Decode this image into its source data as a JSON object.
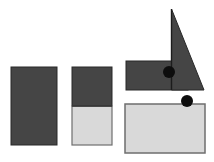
{
  "figure": {
    "description_label": "",
    "canvas": {
      "width": 214,
      "height": 162,
      "background": "#ffffff"
    }
  },
  "colors": {
    "background": "#ffffff",
    "dark_fill": "#454545",
    "dark_stroke": "#282828",
    "light_fill": "#d9d9d9",
    "light_stroke": "#6e6e6e",
    "split_line": "#2e2e2e",
    "edge_line": "#1c1c1c",
    "dot_fill": "#0d0d0d"
  },
  "shapes": [
    {
      "name": "left-dark-rectangle",
      "type": "rect",
      "x": 11,
      "y": 67,
      "w": 46,
      "h": 78,
      "fill": "dark_fill",
      "stroke": "dark_stroke",
      "stroke_width": 1
    },
    {
      "name": "middle-rectangle-dark-half",
      "type": "rect",
      "x": 72,
      "y": 67,
      "w": 40,
      "h": 39,
      "fill": "dark_fill",
      "stroke": "dark_stroke",
      "stroke_width": 1
    },
    {
      "name": "middle-rectangle-light-half",
      "type": "rect",
      "x": 72,
      "y": 106,
      "w": 40,
      "h": 39,
      "fill": "light_fill",
      "stroke": "light_stroke",
      "stroke_width": 1.2
    },
    {
      "name": "middle-rectangle-split-line",
      "type": "line",
      "x1": 72,
      "y1": 106,
      "x2": 112,
      "y2": 106,
      "stroke": "split_line",
      "stroke_width": 1.5
    },
    {
      "name": "right-dark-rectangle",
      "type": "rect",
      "x": 126,
      "y": 61,
      "w": 62,
      "h": 29,
      "fill": "dark_fill",
      "stroke": "dark_stroke",
      "stroke_width": 1
    },
    {
      "name": "right-triangle",
      "type": "polygon",
      "points": "171.5,9 204,90 171.5,90",
      "fill": "dark_fill",
      "stroke": "dark_stroke",
      "stroke_width": 1
    },
    {
      "name": "triangle-vertical-edge-line",
      "type": "line",
      "x1": 171.5,
      "y1": 9,
      "x2": 171.5,
      "y2": 90,
      "stroke": "edge_line",
      "stroke_width": 1.4
    },
    {
      "name": "bottom-light-rectangle",
      "type": "rect",
      "x": 125,
      "y": 104,
      "w": 80,
      "h": 49,
      "fill": "light_fill",
      "stroke": "light_stroke",
      "stroke_width": 1.5
    },
    {
      "name": "dot-on-dark-rectangle",
      "type": "circle",
      "cx": 169,
      "cy": 72,
      "r": 6,
      "fill": "dot_fill"
    },
    {
      "name": "dot-on-light-rectangle",
      "type": "circle",
      "cx": 187,
      "cy": 101,
      "r": 6,
      "fill": "dot_fill"
    }
  ]
}
